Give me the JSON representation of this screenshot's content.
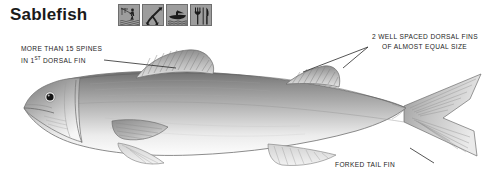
{
  "page": {
    "title": "Sablefish",
    "background_color": "#ffffff"
  },
  "icons": [
    {
      "name": "shore-angler-icon",
      "label": "Shore / rod-and-reel angling"
    },
    {
      "name": "hook-icon",
      "label": "Hook and line"
    },
    {
      "name": "fishing-boat-icon",
      "label": "Boat fishing"
    },
    {
      "name": "fork-knife-icon",
      "label": "Table fare / eating"
    }
  ],
  "annotations": [
    {
      "name": "annotation-spines",
      "line1": "MORE THAN 15 SPINES",
      "line2_prefix": "IN 1",
      "line2_sup": "ST",
      "line2_suffix": " DORSAL FIN"
    },
    {
      "name": "annotation-dorsal-fins",
      "line1": "2 WELL SPACED DORSAL FINS",
      "line2": "OF ALMOST EQUAL SIZE"
    },
    {
      "name": "annotation-forked-tail",
      "line1": "FORKED TAIL FIN"
    }
  ],
  "illustration": {
    "name": "sablefish-illustration",
    "subject": "Sablefish",
    "style": "grayscale pencil field-guide drawing",
    "orientation": "left-facing head, right-facing tail",
    "parts": [
      "head",
      "eye",
      "gill-cover",
      "first-dorsal-fin",
      "second-dorsal-fin",
      "pectoral-fin",
      "pelvic-fin",
      "anal-fin",
      "forked-caudal-fin"
    ],
    "colors": {
      "body_dark": "#7d7d7d",
      "body_mid": "#a8a8a8",
      "body_light": "#e8e8e8",
      "belly": "#fdfdfd",
      "outline": "#6a6a6a",
      "fin_shade": "#b4b4b4",
      "eye": "#141414"
    }
  },
  "leader_lines": {
    "name": "leader-lines",
    "color": "#2a2a2a",
    "count": 3
  }
}
